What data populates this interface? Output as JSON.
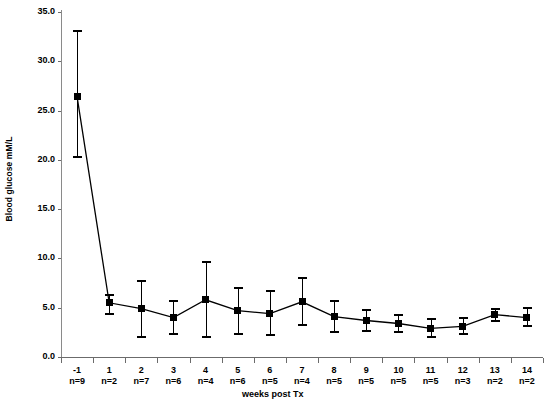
{
  "chart_data": {
    "type": "line",
    "title": "",
    "xlabel": "weeks post Tx",
    "ylabel": "Blood glucose mM/L",
    "ylim": [
      0.0,
      35.0
    ],
    "ytick_step": 5.0,
    "ytick_labels": [
      "35.0",
      "30.0",
      "25.0",
      "20.0",
      "15.0",
      "10.0",
      "5.0",
      "0.0"
    ],
    "ytick_values": [
      35.0,
      30.0,
      25.0,
      20.0,
      15.0,
      10.0,
      5.0,
      0.0
    ],
    "grid": false,
    "legend": "none",
    "marker": "filled-square",
    "errorbars": "caps-both-ends",
    "categories": [
      "-1",
      "1",
      "2",
      "3",
      "4",
      "5",
      "6",
      "7",
      "8",
      "9",
      "10",
      "11",
      "12",
      "13",
      "14"
    ],
    "n_labels": [
      "n=9",
      "n=2",
      "n=7",
      "n=6",
      "n=4",
      "n=6",
      "n=5",
      "n=4",
      "n=5",
      "n=5",
      "n=5",
      "n=5",
      "n=3",
      "n=2",
      "n=2"
    ],
    "n_values": [
      9,
      2,
      7,
      6,
      4,
      6,
      5,
      4,
      5,
      5,
      5,
      5,
      3,
      2,
      2
    ],
    "values": [
      26.4,
      5.5,
      4.9,
      4.0,
      5.8,
      4.7,
      4.4,
      5.6,
      4.1,
      3.7,
      3.4,
      2.9,
      3.1,
      4.3,
      4.0
    ],
    "err_low": [
      20.3,
      4.4,
      2.0,
      2.3,
      2.0,
      2.3,
      2.2,
      3.2,
      2.5,
      2.6,
      2.5,
      2.0,
      2.3,
      3.7,
      3.1
    ],
    "err_high": [
      33.1,
      6.3,
      7.7,
      5.7,
      9.6,
      7.0,
      6.7,
      8.0,
      5.7,
      4.8,
      4.3,
      3.9,
      4.0,
      4.9,
      5.0
    ]
  },
  "colors": {
    "series": "#000000",
    "axis": "#6b6b6b",
    "axis_y": "#8a8a8a",
    "background": "#ffffff"
  }
}
